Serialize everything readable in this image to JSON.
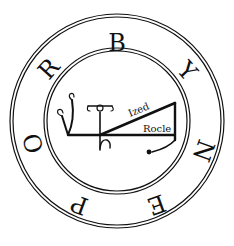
{
  "seal": {
    "ring_letters": [
      {
        "char": "B",
        "x": 117,
        "y": 44,
        "rot": 0
      },
      {
        "char": "Y",
        "x": 186,
        "y": 72,
        "rot": 48
      },
      {
        "char": "N",
        "x": 202,
        "y": 150,
        "rot": 110
      },
      {
        "char": "E",
        "x": 156,
        "y": 203,
        "rot": 160
      },
      {
        "char": "P",
        "x": 80,
        "y": 203,
        "rot": 200
      },
      {
        "char": "O",
        "x": 35,
        "y": 143,
        "rot": 255
      },
      {
        "char": "R",
        "x": 50,
        "y": 70,
        "rot": 312
      }
    ],
    "labels": {
      "upper": "Ized",
      "lower": "Rocle"
    },
    "colors": {
      "ink": "#111111",
      "background": "#ffffff"
    }
  }
}
